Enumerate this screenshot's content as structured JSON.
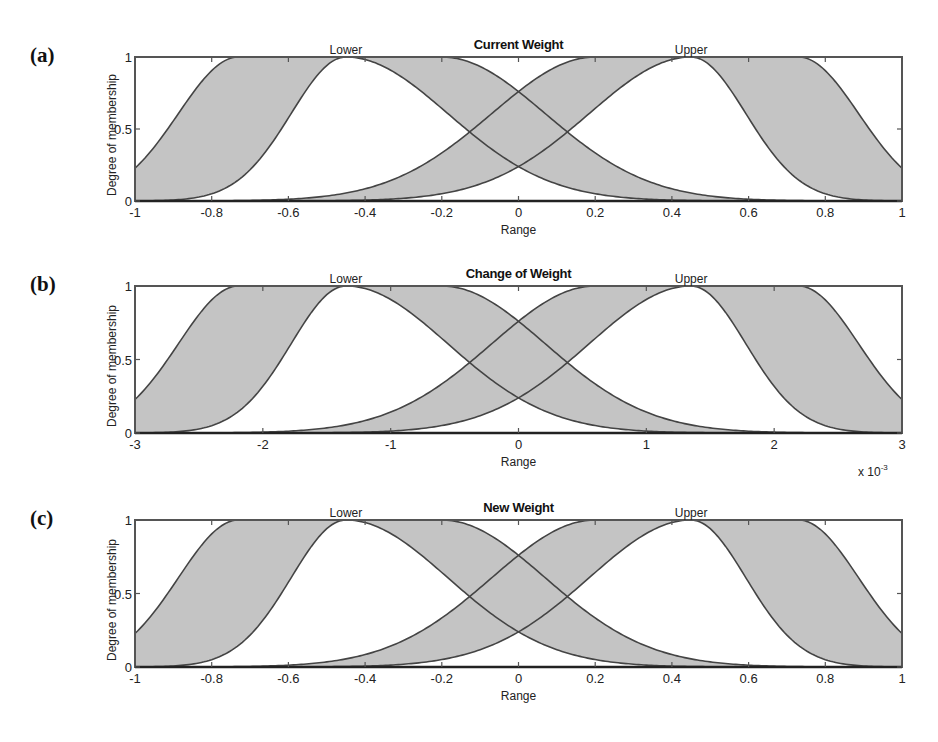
{
  "figure": {
    "axis_color": "#555555",
    "fill_color": "#c4c4c4",
    "line_color": "#444444"
  },
  "chart_data": [
    {
      "type": "area",
      "panel_label": "(a)",
      "title": "Current Weight",
      "xlabel": "Range",
      "ylabel": "Degree of membership",
      "xlim": [
        -1,
        1
      ],
      "ylim": [
        0,
        1
      ],
      "x_ticks": [
        "-1",
        "-0.8",
        "-0.6",
        "-0.4",
        "-0.2",
        "0",
        "0.2",
        "0.4",
        "0.6",
        "0.8",
        "1"
      ],
      "y_ticks": [
        "0",
        "0.5",
        "1"
      ],
      "x_multiplier": "",
      "grid": false,
      "legend": "none",
      "series": [
        {
          "name": "Lower",
          "kind": "interval type-2 MF",
          "umf": {
            "flat_from": -0.73,
            "flat_to": -0.2,
            "left_sigma": 0.157,
            "right_sigma": 0.27
          },
          "lmf": {
            "peak": -0.45,
            "left_sigma": 0.143,
            "right_sigma": 0.266
          },
          "label_x": -0.45
        },
        {
          "name": "Upper",
          "kind": "interval type-2 MF",
          "umf": {
            "flat_from": 0.2,
            "flat_to": 0.73,
            "left_sigma": 0.27,
            "right_sigma": 0.157
          },
          "lmf": {
            "peak": 0.45,
            "left_sigma": 0.266,
            "right_sigma": 0.143
          },
          "label_x": 0.45
        }
      ]
    },
    {
      "type": "area",
      "panel_label": "(b)",
      "title": "Change of Weight",
      "xlabel": "Range",
      "ylabel": "Degree of membership",
      "xlim": [
        -3,
        3
      ],
      "ylim": [
        0,
        1
      ],
      "x_ticks": [
        "-3",
        "-2",
        "-1",
        "0",
        "1",
        "2",
        "3"
      ],
      "y_ticks": [
        "0",
        "0.5",
        "1"
      ],
      "x_multiplier": "x 10",
      "x_multiplier_exp": "-3",
      "grid": false,
      "legend": "none",
      "series": [
        {
          "name": "Lower",
          "kind": "interval type-2 MF",
          "umf": {
            "flat_from": -2.19,
            "flat_to": -0.6,
            "left_sigma": 0.471,
            "right_sigma": 0.81
          },
          "lmf": {
            "peak": -1.35,
            "left_sigma": 0.429,
            "right_sigma": 0.798
          },
          "label_x": -1.35
        },
        {
          "name": "Upper",
          "kind": "interval type-2 MF",
          "umf": {
            "flat_from": 0.6,
            "flat_to": 2.19,
            "left_sigma": 0.81,
            "right_sigma": 0.471
          },
          "lmf": {
            "peak": 1.35,
            "left_sigma": 0.798,
            "right_sigma": 0.429
          },
          "label_x": 1.35
        }
      ]
    },
    {
      "type": "area",
      "panel_label": "(c)",
      "title": "New Weight",
      "xlabel": "Range",
      "ylabel": "Degree of membership",
      "xlim": [
        -1,
        1
      ],
      "ylim": [
        0,
        1
      ],
      "x_ticks": [
        "-1",
        "-0.8",
        "-0.6",
        "-0.4",
        "-0.2",
        "0",
        "0.2",
        "0.4",
        "0.6",
        "0.8",
        "1"
      ],
      "y_ticks": [
        "0",
        "0.5",
        "1"
      ],
      "x_multiplier": "",
      "grid": false,
      "legend": "none",
      "series": [
        {
          "name": "Lower",
          "kind": "interval type-2 MF",
          "umf": {
            "flat_from": -0.73,
            "flat_to": -0.2,
            "left_sigma": 0.157,
            "right_sigma": 0.27
          },
          "lmf": {
            "peak": -0.45,
            "left_sigma": 0.143,
            "right_sigma": 0.266
          },
          "label_x": -0.45
        },
        {
          "name": "Upper",
          "kind": "interval type-2 MF",
          "umf": {
            "flat_from": 0.2,
            "flat_to": 0.73,
            "left_sigma": 0.27,
            "right_sigma": 0.157
          },
          "lmf": {
            "peak": 0.45,
            "left_sigma": 0.266,
            "right_sigma": 0.143
          },
          "label_x": 0.45
        }
      ]
    }
  ],
  "layout": {
    "panels": [
      {
        "left": 135,
        "right": 902,
        "top": 57,
        "bottom": 201
      },
      {
        "left": 135,
        "right": 902,
        "top": 286,
        "bottom": 433
      },
      {
        "left": 135,
        "right": 902,
        "top": 520,
        "bottom": 667
      }
    ]
  }
}
